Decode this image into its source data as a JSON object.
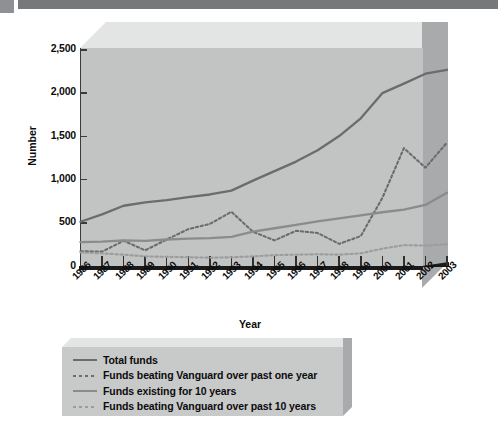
{
  "banner": {
    "name": "top-decorative-bar"
  },
  "chart_data": {
    "type": "line",
    "title": "",
    "xlabel": "Year",
    "ylabel": "Number",
    "grid": false,
    "legend_position": "bottom",
    "ylim": [
      0,
      2500
    ],
    "yticks": [
      "0",
      "500",
      "1,000",
      "1,500",
      "2,000",
      "2,500"
    ],
    "ytick_values": [
      0,
      500,
      1000,
      1500,
      2000,
      2500
    ],
    "categories": [
      "1986",
      "1987",
      "1988",
      "1989",
      "1990",
      "1991",
      "1992",
      "1993",
      "1994",
      "1995",
      "1996",
      "1997",
      "1998",
      "1999",
      "2000",
      "2001",
      "2002",
      "2003"
    ],
    "series": [
      {
        "name": "Total funds",
        "style": "solid",
        "color": "#6b6c6e",
        "values": [
          505,
          590,
          690,
          730,
          755,
          790,
          820,
          865,
          980,
          1090,
          1200,
          1330,
          1495,
          1700,
          1990,
          2100,
          2215,
          2260
        ]
      },
      {
        "name": "Funds beating Vanguard over past one year",
        "style": "dotted",
        "color": "#6b6c6e",
        "values": [
          165,
          160,
          285,
          175,
          300,
          420,
          480,
          620,
          390,
          290,
          400,
          375,
          250,
          340,
          780,
          1355,
          1130,
          1420
        ]
      },
      {
        "name": "Funds existing for 10 years",
        "style": "solid",
        "color": "#8a8b8d",
        "values": [
          270,
          275,
          290,
          285,
          300,
          310,
          315,
          330,
          390,
          430,
          470,
          510,
          545,
          580,
          615,
          645,
          700,
          840
        ]
      },
      {
        "name": "Funds beating Vanguard over past 10 years",
        "style": "dotted",
        "color": "#9b9c9e",
        "values": [
          150,
          140,
          125,
          105,
          100,
          95,
          90,
          95,
          105,
          120,
          125,
          130,
          125,
          140,
          195,
          235,
          230,
          245
        ]
      }
    ]
  },
  "legend": {
    "items": [
      {
        "label": "Total funds",
        "swatch": "sw-solid-dark"
      },
      {
        "label": "Funds beating Vanguard over past one year",
        "swatch": "sw-dot-dark"
      },
      {
        "label": "Funds existing for 10 years",
        "swatch": "sw-solid-mid"
      },
      {
        "label": "Funds beating Vanguard over past 10 years",
        "swatch": "sw-dot-light"
      }
    ]
  }
}
